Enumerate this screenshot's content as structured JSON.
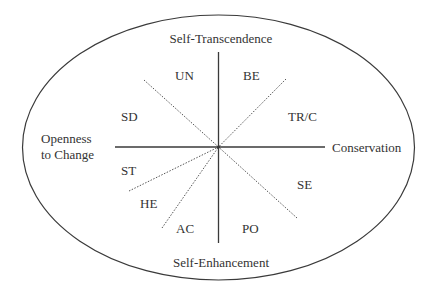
{
  "diagram": {
    "axes": {
      "top": "Self-Transcendence",
      "bottom": "Self-Enhancement",
      "left_line1": "Openness",
      "left_line2": "to Change",
      "right": "Conservation"
    },
    "values": [
      {
        "code": "UN"
      },
      {
        "code": "BE"
      },
      {
        "code": "TR/C"
      },
      {
        "code": "SE"
      },
      {
        "code": "PO"
      },
      {
        "code": "AC"
      },
      {
        "code": "HE"
      },
      {
        "code": "ST"
      },
      {
        "code": "SD"
      }
    ],
    "colors": {
      "line": "#3a3a3a",
      "dotted": "#555555",
      "text": "#333333",
      "background": "#ffffff"
    }
  }
}
